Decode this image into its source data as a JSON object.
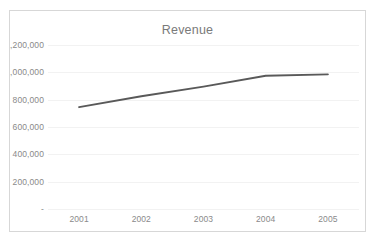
{
  "chart_data": {
    "type": "line",
    "title": "Revenue",
    "xlabel": "",
    "ylabel": "",
    "x": [
      "2001",
      "2002",
      "2003",
      "2004",
      "2005"
    ],
    "categories": [
      "2001",
      "2002",
      "2003",
      "2004",
      "2005"
    ],
    "series": [
      {
        "name": "Revenue",
        "values": [
          745000,
          825000,
          895000,
          975000,
          985000
        ],
        "color": "#595959"
      }
    ],
    "values": [
      745000,
      825000,
      895000,
      975000,
      985000
    ],
    "ylim": [
      0,
      1200000
    ],
    "y_ticks": [
      0,
      200000,
      400000,
      600000,
      800000,
      1000000,
      1200000
    ],
    "y_tick_labels": [
      "-",
      "200,000",
      "400,000",
      "600,000",
      "800,000",
      "1,000,000",
      "1,200,000"
    ],
    "grid": true,
    "grid_axis": "y",
    "legend": false,
    "legend_position": "none",
    "markers": false,
    "annotations": []
  },
  "chart": {
    "title": "Revenue",
    "y_axis": {
      "tick_labels": [
        "1,200,000",
        "1,000,000",
        "800,000",
        "600,000",
        "400,000",
        "200,000",
        "-"
      ]
    },
    "x_axis": {
      "tick_labels": [
        "2001",
        "2002",
        "2003",
        "2004",
        "2005"
      ]
    }
  },
  "colors": {
    "series_line": "#595959",
    "gridline": "#f2f2f2",
    "axis_text": "#8a8a8a",
    "title_text": "#7a7a7a",
    "frame_border": "#d7d7d7",
    "background": "#ffffff"
  }
}
